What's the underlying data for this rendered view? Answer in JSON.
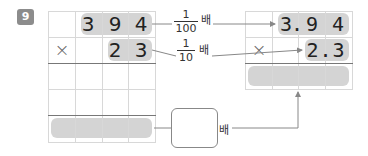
{
  "problem": {
    "number": "9"
  },
  "left_grid": {
    "multiplicand_digits": [
      "",
      "3",
      "9",
      "4"
    ],
    "operator": "×",
    "multiplier_digits": [
      "",
      "",
      "2",
      "3"
    ]
  },
  "right_grid": {
    "multiplicand": "3.94",
    "multiplicand_display": [
      "3",
      ".",
      "9",
      " ",
      "4"
    ],
    "operator": "×",
    "multiplier": "2.3"
  },
  "fractions": {
    "top": {
      "numerator": "1",
      "denominator": "100",
      "suffix": "배"
    },
    "bottom": {
      "numerator": "1",
      "denominator": "10",
      "suffix": "배"
    }
  },
  "answer": {
    "blank_value": "",
    "suffix": "배"
  },
  "colors": {
    "highlight": "#d4d4d4",
    "badge": "#8c8c8c",
    "grid_line": "#d8d8d8",
    "grid_line_dark": "#777777",
    "arrow": "#888888"
  }
}
